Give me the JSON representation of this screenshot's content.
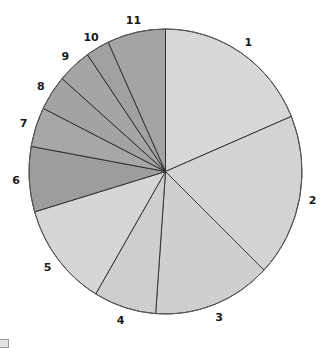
{
  "chart_data": {
    "type": "pie",
    "title": "",
    "categories": [
      "1",
      "2",
      "3",
      "4",
      "5",
      "6",
      "7",
      "8",
      "9",
      "10",
      "11"
    ],
    "values": [
      18.7,
      18.5,
      14.0,
      7.4,
      11.9,
      7.4,
      4.5,
      4.0,
      4.0,
      2.8,
      6.9
    ],
    "units": "percent (estimated from slice angles)",
    "start_angle": "12 o'clock, clockwise",
    "colors": [
      "#dedede",
      "#dadada",
      "#d6d6d6",
      "#d4d4d4",
      "#dcdcdc",
      "#a2a2a2",
      "#acacac",
      "#a8a8a8",
      "#aaaaaa",
      "#a6a6a6",
      "#a9a9a9"
    ],
    "legend": "none (slice labels placed outside the pie)",
    "grid": false
  },
  "labels": [
    "1",
    "2",
    "3",
    "4",
    "5",
    "6",
    "7",
    "8",
    "9",
    "10",
    "11"
  ]
}
